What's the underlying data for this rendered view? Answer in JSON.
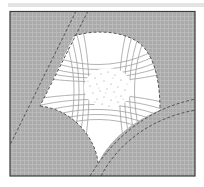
{
  "figure": {
    "type": "schematic-diagram",
    "colors": {
      "field": "#a9a9a9",
      "grid": "#c4c4c4",
      "blob": "#ffffff",
      "contour": "#9a9a9a",
      "dashed_boundary": "#555555",
      "frame": "#3a3a3a",
      "stipple": "#7a7a7a",
      "top_band": "#e4e4e4"
    },
    "regions": [
      {
        "name": "gray-field",
        "label": ""
      },
      {
        "name": "white-central-region",
        "label": ""
      },
      {
        "name": "stippled-core",
        "label": ""
      },
      {
        "name": "upper-left-band",
        "label": ""
      },
      {
        "name": "lower-right-band",
        "label": ""
      },
      {
        "name": "lower-left-lobe",
        "label": ""
      }
    ]
  }
}
